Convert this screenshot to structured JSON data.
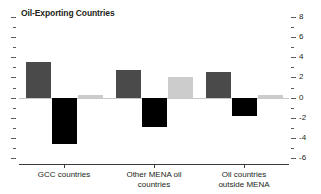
{
  "chart_data": {
    "type": "bar",
    "title": "Oil-Exporting Countries",
    "xlabel": "",
    "ylabel": "",
    "ylim": [
      -6,
      8
    ],
    "grid": false,
    "legend_position": "none",
    "y_major_ticks": [
      8,
      6,
      4,
      2,
      0,
      -2,
      -4,
      -6
    ],
    "y_tick_labels": [
      "8",
      "6",
      "4",
      "2",
      "0",
      "-2",
      "-4",
      "-6"
    ],
    "y_minor_ticks": [
      7,
      5,
      3,
      1,
      -1,
      -3,
      -5
    ],
    "y_axis_side": "right",
    "categories": [
      "GCC countries",
      "Other MENA oil\ncountries",
      "Oil countries\noutside MENA"
    ],
    "series": [
      {
        "name": "series-1",
        "color": "#4a4a4a",
        "values": [
          3.5,
          2.7,
          2.5
        ]
      },
      {
        "name": "series-2",
        "color": "#000000",
        "values": [
          -4.6,
          -2.9,
          -1.8
        ]
      },
      {
        "name": "series-3",
        "color": "#cccccc",
        "values": [
          0.3,
          2.0,
          0.25
        ]
      }
    ]
  },
  "colors": {
    "series_dark_gray": "#4a4a4a",
    "series_black": "#000000",
    "series_light_gray": "#cccccc",
    "axis": "#3a3a3a",
    "zero_line": "#c8c8c8",
    "text": "#231f20",
    "background": "#ffffff"
  }
}
